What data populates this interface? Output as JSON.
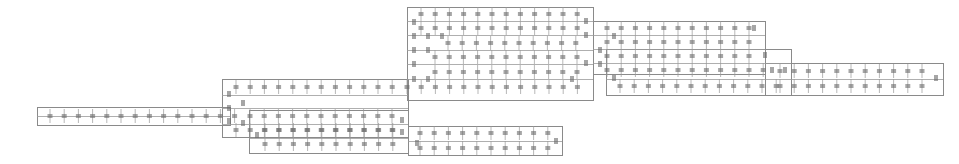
{
  "diagram": {
    "type": "battery-pack-cell-layout",
    "colors": {
      "line": "#8a8a8a",
      "cell": "#6a6a6a",
      "background": "#ffffff"
    },
    "frames": [
      {
        "id": "left-strip",
        "x": 37,
        "y": 107,
        "w": 193,
        "h": 18
      },
      {
        "id": "mid-left",
        "x": 222,
        "y": 79,
        "w": 186,
        "h": 58
      },
      {
        "id": "bottom-mid",
        "x": 249,
        "y": 110,
        "w": 159,
        "h": 43
      },
      {
        "id": "bottom-right",
        "x": 408,
        "y": 126,
        "w": 154,
        "h": 29
      },
      {
        "id": "top-main",
        "x": 407,
        "y": 7,
        "w": 186,
        "h": 93
      },
      {
        "id": "right-upper",
        "x": 593,
        "y": 21,
        "w": 172,
        "h": 53
      },
      {
        "id": "right-mid",
        "x": 606,
        "y": 49,
        "w": 185,
        "h": 46
      },
      {
        "id": "far-right",
        "x": 765,
        "y": 63,
        "w": 178,
        "h": 32
      }
    ],
    "rails": [
      {
        "y": 116,
        "x1": 37,
        "x2": 230
      },
      {
        "y": 95,
        "x1": 222,
        "x2": 408
      },
      {
        "y": 108,
        "x1": 222,
        "x2": 408
      },
      {
        "y": 124,
        "x1": 222,
        "x2": 408
      },
      {
        "y": 138,
        "x1": 249,
        "x2": 408
      },
      {
        "y": 141,
        "x1": 408,
        "x2": 562
      },
      {
        "y": 21,
        "x1": 407,
        "x2": 593
      },
      {
        "y": 35,
        "x1": 407,
        "x2": 593
      },
      {
        "y": 50,
        "x1": 407,
        "x2": 593
      },
      {
        "y": 64,
        "x1": 407,
        "x2": 593
      },
      {
        "y": 79,
        "x1": 407,
        "x2": 593
      },
      {
        "y": 35,
        "x1": 593,
        "x2": 765
      },
      {
        "y": 49,
        "x1": 593,
        "x2": 765
      },
      {
        "y": 63,
        "x1": 593,
        "x2": 791
      },
      {
        "y": 79,
        "x1": 606,
        "x2": 943
      }
    ],
    "cell_rows": [
      {
        "y": 116,
        "x0": 50,
        "dx": 14.2,
        "n": 14
      },
      {
        "y": 87,
        "x0": 236,
        "dx": 14.2,
        "n": 12
      },
      {
        "y": 116,
        "x0": 250,
        "dx": 14.2,
        "n": 11
      },
      {
        "y": 130,
        "x0": 236,
        "dx": 14.2,
        "n": 12
      },
      {
        "y": 130,
        "x0": 265,
        "dx": 14.2,
        "n": 10
      },
      {
        "y": 144,
        "x0": 265,
        "dx": 14.2,
        "n": 10
      },
      {
        "y": 133,
        "x0": 420,
        "dx": 14.2,
        "n": 10
      },
      {
        "y": 148,
        "x0": 420,
        "dx": 14.2,
        "n": 10
      },
      {
        "y": 14,
        "x0": 421,
        "dx": 14.2,
        "n": 12
      },
      {
        "y": 28,
        "x0": 421,
        "dx": 14.2,
        "n": 12
      },
      {
        "y": 43,
        "x0": 448,
        "dx": 14.2,
        "n": 10
      },
      {
        "y": 57,
        "x0": 435,
        "dx": 14.2,
        "n": 11
      },
      {
        "y": 72,
        "x0": 435,
        "dx": 14.2,
        "n": 11
      },
      {
        "y": 87,
        "x0": 407,
        "dx": 14.2,
        "n": 13
      },
      {
        "y": 28,
        "x0": 607,
        "dx": 14.2,
        "n": 11
      },
      {
        "y": 42,
        "x0": 607,
        "dx": 14.2,
        "n": 11
      },
      {
        "y": 56,
        "x0": 607,
        "dx": 14.2,
        "n": 11
      },
      {
        "y": 70,
        "x0": 607,
        "dx": 14.2,
        "n": 12
      },
      {
        "y": 86,
        "x0": 620,
        "dx": 14.2,
        "n": 12
      },
      {
        "y": 71,
        "x0": 780,
        "dx": 14.2,
        "n": 11
      },
      {
        "y": 86,
        "x0": 780,
        "dx": 14.2,
        "n": 11
      }
    ],
    "vertical_cells": [
      {
        "x": 229,
        "y": 94
      },
      {
        "x": 229,
        "y": 108
      },
      {
        "x": 229,
        "y": 121
      },
      {
        "x": 243,
        "y": 123
      },
      {
        "x": 257,
        "y": 135
      },
      {
        "x": 414,
        "y": 22
      },
      {
        "x": 414,
        "y": 36
      },
      {
        "x": 414,
        "y": 50
      },
      {
        "x": 414,
        "y": 64
      },
      {
        "x": 414,
        "y": 79
      },
      {
        "x": 428,
        "y": 36
      },
      {
        "x": 428,
        "y": 50
      },
      {
        "x": 428,
        "y": 79
      },
      {
        "x": 442,
        "y": 36
      },
      {
        "x": 586,
        "y": 21
      },
      {
        "x": 586,
        "y": 35
      },
      {
        "x": 586,
        "y": 63
      },
      {
        "x": 600,
        "y": 50
      },
      {
        "x": 600,
        "y": 64
      },
      {
        "x": 572,
        "y": 79
      },
      {
        "x": 614,
        "y": 36
      },
      {
        "x": 614,
        "y": 78
      },
      {
        "x": 754,
        "y": 28
      },
      {
        "x": 765,
        "y": 55
      },
      {
        "x": 772,
        "y": 70
      },
      {
        "x": 785,
        "y": 70
      },
      {
        "x": 936,
        "y": 78
      },
      {
        "x": 402,
        "y": 120
      },
      {
        "x": 402,
        "y": 132
      },
      {
        "x": 417,
        "y": 143
      },
      {
        "x": 556,
        "y": 141
      },
      {
        "x": 243,
        "y": 103
      }
    ]
  }
}
